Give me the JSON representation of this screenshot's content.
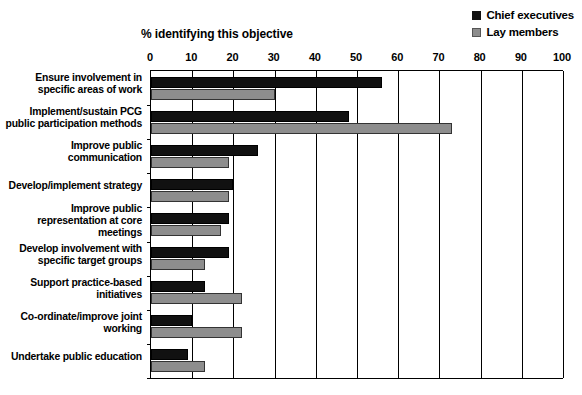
{
  "legend": {
    "entries": [
      {
        "label": "Chief executives",
        "color": "#111111",
        "icon": "filled-square-icon"
      },
      {
        "label": "Lay members",
        "color": "#8d8d8d",
        "icon": "filled-square-icon"
      }
    ]
  },
  "chart_data": {
    "type": "bar",
    "orientation": "horizontal",
    "title": "% identifying this objective",
    "xlabel": "% identifying this objective",
    "ylabel": "",
    "xlim": [
      0,
      100
    ],
    "xticks": [
      0,
      10,
      20,
      30,
      40,
      50,
      60,
      70,
      80,
      90,
      100
    ],
    "grid": true,
    "legend_position": "top-right",
    "categories": [
      "Ensure involvement in specific areas of work",
      "Implement/sustain PCG public participation methods",
      "Improve public communication",
      "Develop/implement strategy",
      "Improve public representation at core meetings",
      "Develop involvement with specific target groups",
      "Support practice-based initiatives",
      "Co-ordinate/improve joint working",
      "Undertake public education"
    ],
    "series": [
      {
        "name": "Chief executives",
        "color": "#111111",
        "values": [
          56,
          48,
          26,
          20,
          19,
          19,
          13,
          10,
          9
        ]
      },
      {
        "name": "Lay members",
        "color": "#8d8d8d",
        "values": [
          30,
          73,
          19,
          19,
          17,
          13,
          22,
          22,
          13
        ]
      }
    ]
  }
}
